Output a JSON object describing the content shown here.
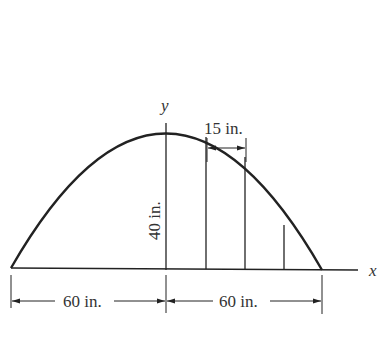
{
  "figure": {
    "axis_x_label": "x",
    "axis_y_label": "y",
    "height_label": "40 in.",
    "strip_width_label": "15 in.",
    "left_span_label": "60 in.",
    "right_span_label": "60 in.",
    "curve": "parabola",
    "apex_height_in": 40,
    "half_span_in": 60,
    "strip_width_in": 15,
    "vertical_strip_count": 3,
    "colors": {
      "ink": "#222222",
      "background": "#ffffff"
    }
  }
}
